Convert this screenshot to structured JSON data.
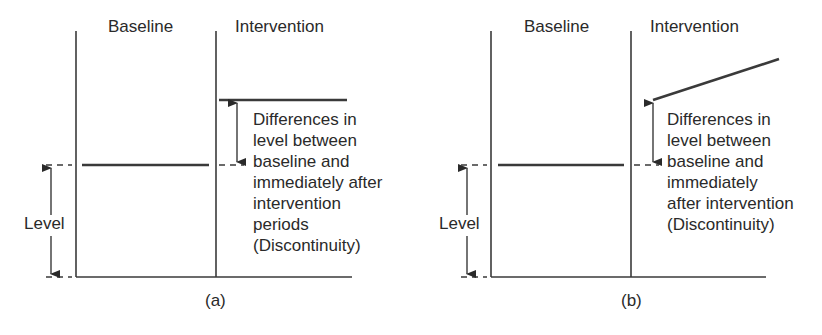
{
  "panels": [
    {
      "id": "a",
      "label": "(a)",
      "phase_labels": {
        "baseline": "Baseline",
        "intervention": "Intervention"
      },
      "level_label": "Level",
      "annotation": "Differences in\nlevel between\nbaseline and\nimmediately after\nintervention\nperiods\n(Discontinuity)",
      "intervention_trend": "flat"
    },
    {
      "id": "b",
      "label": "(b)",
      "phase_labels": {
        "baseline": "Baseline",
        "intervention": "Intervention"
      },
      "level_label": "Level",
      "annotation": "Differences in\nlevel between\nbaseline and\nimmediately\nafter intervention\n(Discontinuity)",
      "intervention_trend": "rising"
    }
  ],
  "colors": {
    "line": "#3a3a3a",
    "text": "#2a2a2a",
    "background": "#ffffff"
  }
}
